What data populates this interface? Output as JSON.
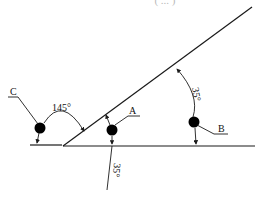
{
  "diagram": {
    "type": "physics-inclined-plane",
    "top_caption_cut": "( ... )",
    "balls": [
      {
        "label": "C",
        "description": "ball left of incline base"
      },
      {
        "label": "A",
        "description": "ball between incline and ground"
      },
      {
        "label": "B",
        "description": "ball under incline, right side"
      }
    ],
    "angles": {
      "obtuse": "145°",
      "incline_at_B": "35°",
      "below_A": "35°"
    },
    "colors": {
      "line": "#1a1a1a",
      "ball": "#000000",
      "background": "#ffffff"
    }
  }
}
